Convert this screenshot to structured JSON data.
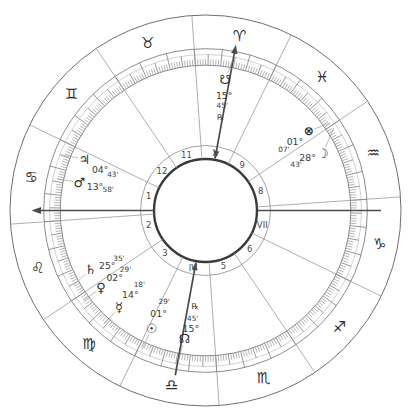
{
  "chart": {
    "kind": "natal-wheel",
    "retrograde_symbol": "℞",
    "palette": {
      "background": "#ffffff",
      "ring_line": "#6f6f6f",
      "boundary_line": "#8d8d8d",
      "tick_line": "#777777",
      "axis_line": "#4b4b4b",
      "inner_circle": "#3a3a3a",
      "text": "#3a3a3a",
      "glyph": "#2e2e2e",
      "pointer_line": "#909090",
      "house_number": "#4a4a4a"
    },
    "asc_axis_longitude": 116,
    "mc_axis_longitude": 15.6,
    "signs": [
      {
        "id": "aries",
        "glyph": "♈",
        "mid_longitude": 15
      },
      {
        "id": "taurus",
        "glyph": "♉",
        "mid_longitude": 45
      },
      {
        "id": "gemini",
        "glyph": "♊",
        "mid_longitude": 75
      },
      {
        "id": "cancer",
        "glyph": "♋",
        "mid_longitude": 105
      },
      {
        "id": "leo",
        "glyph": "♌",
        "mid_longitude": 135
      },
      {
        "id": "virgo",
        "glyph": "♍",
        "mid_longitude": 165
      },
      {
        "id": "libra",
        "glyph": "♎",
        "mid_longitude": 195
      },
      {
        "id": "scorpio",
        "glyph": "♏",
        "mid_longitude": 225
      },
      {
        "id": "sagittarius",
        "glyph": "♐",
        "mid_longitude": 255
      },
      {
        "id": "capricorn",
        "glyph": "♑",
        "mid_longitude": 285
      },
      {
        "id": "aquarius",
        "glyph": "♒",
        "mid_longitude": 315
      },
      {
        "id": "pisces",
        "glyph": "♓",
        "mid_longitude": 345
      }
    ],
    "houses": [
      {
        "label": "1",
        "mid_longitude": 102
      },
      {
        "label": "2",
        "mid_longitude": 130
      },
      {
        "label": "3",
        "mid_longitude": 162
      },
      {
        "label": "IV",
        "mid_longitude": 193.5
      },
      {
        "label": "5",
        "mid_longitude": 224
      },
      {
        "label": "6",
        "mid_longitude": 255
      },
      {
        "label": "VII",
        "mid_longitude": 282
      },
      {
        "label": "8",
        "mid_longitude": 315
      },
      {
        "label": "9",
        "mid_longitude": 347
      },
      {
        "label": "X",
        "mid_longitude": 16.5
      },
      {
        "label": "11",
        "mid_longitude": 45
      },
      {
        "label": "12",
        "mid_longitude": 74
      }
    ],
    "planets": [
      {
        "id": "jupiter",
        "glyph": "♃",
        "deg": "04°",
        "min": "43'",
        "sign": "cancer",
        "longitude": 94.717,
        "retrograde": false
      },
      {
        "id": "mars",
        "glyph": "♂",
        "deg": "13°",
        "min": "58'",
        "sign": "cancer",
        "longitude": 103.967,
        "retrograde": false
      },
      {
        "id": "saturn",
        "glyph": "♄",
        "deg": "25°",
        "min": "35'",
        "sign": "leo",
        "longitude": 145.583,
        "retrograde": false
      },
      {
        "id": "venus",
        "glyph": "♀",
        "deg": "02°",
        "min": "29'",
        "sign": "virgo",
        "longitude": 152.483,
        "retrograde": false
      },
      {
        "id": "mercury",
        "glyph": "☿",
        "deg": "14°",
        "min": "18'",
        "sign": "virgo",
        "longitude": 164.3,
        "retrograde": false
      },
      {
        "id": "sun",
        "glyph": "☉",
        "deg": "01°",
        "min": "29'",
        "sign": "libra",
        "longitude": 181.483,
        "retrograde": false
      },
      {
        "id": "north-node",
        "glyph": "☊",
        "deg": "15°",
        "min": "45'",
        "sign": "libra",
        "longitude": 195.75,
        "retrograde": true
      },
      {
        "id": "south-node",
        "glyph": "☋",
        "deg": "15°",
        "min": "45'",
        "sign": "aries",
        "longitude": 15.75,
        "retrograde": true
      },
      {
        "id": "moon",
        "glyph": "☽",
        "deg": "28°",
        "min": "43'",
        "sign": "aquarius",
        "longitude": 328.717,
        "retrograde": false
      },
      {
        "id": "part-of-fortune",
        "glyph": "⊗",
        "deg": "01°",
        "min": "07'",
        "sign": "pisces",
        "longitude": 331.117,
        "retrograde": false
      }
    ]
  }
}
